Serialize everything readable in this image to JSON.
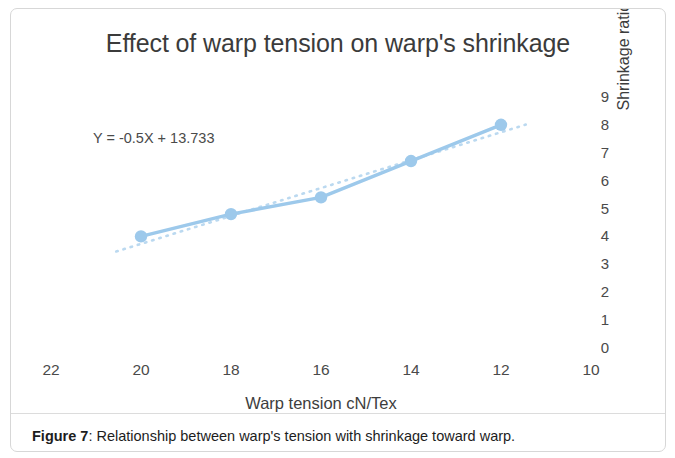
{
  "figure": {
    "caption_label": "Figure 7",
    "caption_separator": ": ",
    "caption_text": "Relationship between warp's tension with shrinkage toward warp."
  },
  "chart_data": {
    "type": "line",
    "title": "Effect of warp tension on warp's shrinkage",
    "xlabel": "Warp tension cN/Tex",
    "ylabel": "Shrinkage ratio (%)",
    "x": [
      20,
      18,
      16,
      14,
      12
    ],
    "values": [
      4.0,
      4.8,
      5.4,
      6.7,
      8.0
    ],
    "series": [
      {
        "name": "Shrinkage ratio",
        "values": [
          4.0,
          4.8,
          5.4,
          6.7,
          8.0
        ],
        "color": "#9DC9EB",
        "marker": "circle",
        "line_style": "solid"
      },
      {
        "name": "Linear trendline",
        "equation": "Y = -0.5X + 13.733",
        "slope": -0.5,
        "intercept": 13.733,
        "color": "#BBD9F0",
        "line_style": "dotted"
      }
    ],
    "xticks": [
      "22",
      "20",
      "18",
      "16",
      "14",
      "12",
      "10"
    ],
    "xtick_values": [
      22,
      20,
      18,
      16,
      14,
      12,
      10
    ],
    "xlim": [
      23,
      9
    ],
    "x_axis_direction": "descending",
    "yticks": [
      "0",
      "1",
      "2",
      "3",
      "4",
      "5",
      "6",
      "7",
      "8",
      "9"
    ],
    "ytick_values": [
      0,
      1,
      2,
      3,
      4,
      5,
      6,
      7,
      8,
      9
    ],
    "ylim": [
      0,
      9
    ],
    "y_axis_position": "right",
    "grid": false,
    "legend": "none",
    "annotations": [
      {
        "text": "Y = -0.5X + 13.733"
      }
    ],
    "plot_background": "#ffffff"
  },
  "colors": {
    "series_line": "#9DC9EB",
    "marker_fill": "#9DC9EB",
    "trendline": "#BBD9F0",
    "panel_border": "#d7d7d7",
    "axis_text": "#4a4a4a",
    "title_text": "#3b3b3b",
    "caption_text": "#1d1d1d"
  }
}
